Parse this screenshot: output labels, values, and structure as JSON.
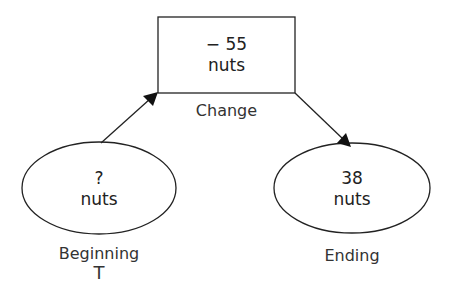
{
  "diagram": {
    "change": {
      "value": "− 55",
      "unit": "nuts",
      "label": "Change"
    },
    "beginning": {
      "value": "?",
      "unit": "nuts",
      "label": "Beginning",
      "sublabel": "T"
    },
    "ending": {
      "value": "38",
      "unit": "nuts",
      "label": "Ending"
    },
    "colors": {
      "stroke": "#222222",
      "text": "#333333",
      "background": "#ffffff"
    }
  }
}
